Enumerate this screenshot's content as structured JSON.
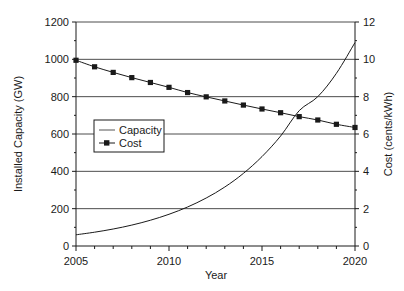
{
  "chart_data": {
    "type": "line",
    "title": "",
    "xlabel": "Year",
    "ylabel": "Installed Capacity (GW)",
    "y2label": "Cost  (cents/kWh)",
    "x": [
      2005,
      2006,
      2007,
      2008,
      2009,
      2010,
      2011,
      2012,
      2013,
      2014,
      2015,
      2016,
      2017,
      2018,
      2019,
      2020
    ],
    "xlim": [
      2005,
      2020
    ],
    "ylim": [
      0,
      1200
    ],
    "y2lim": [
      0,
      12
    ],
    "xticks": [
      2005,
      2010,
      2015,
      2020
    ],
    "xtick_labels": [
      "2005",
      "2010",
      "2015",
      "2020"
    ],
    "xminor_step": 1,
    "yticks": [
      0,
      200,
      400,
      600,
      800,
      1000,
      1200
    ],
    "ytick_labels": [
      "0",
      "200",
      "400",
      "600",
      "800",
      "1000",
      "1200"
    ],
    "y2ticks": [
      0,
      2,
      4,
      6,
      8,
      10,
      12
    ],
    "y2tick_labels": [
      "0",
      "2",
      "4",
      "6",
      "8",
      "10",
      "12"
    ],
    "grid": "horizontal",
    "legend_position": "center-left",
    "series": [
      {
        "name": "Capacity",
        "axis": "left",
        "units": "GW",
        "marker": "none",
        "line": "solid",
        "color": "#1a1a1a",
        "values": [
          60,
          74,
          91,
          112,
          138,
          170,
          209,
          257,
          316,
          389,
          479,
          589,
          725,
          800,
          925,
          1090
        ]
      },
      {
        "name": "Cost",
        "axis": "right",
        "units": "cents/kWh",
        "marker": "square",
        "line": "solid",
        "color": "#1a1a1a",
        "values": [
          9.95,
          9.6,
          9.3,
          9.02,
          8.76,
          8.5,
          8.22,
          7.99,
          7.77,
          7.55,
          7.34,
          7.14,
          6.93,
          6.75,
          6.52,
          6.35
        ]
      }
    ]
  },
  "legend": {
    "entries": [
      {
        "label": "Capacity",
        "marker": "line"
      },
      {
        "label": "Cost",
        "marker": "line-square"
      }
    ]
  },
  "colors": {
    "axis": "#1a1a1a",
    "grid": "#4d4d4d",
    "series": "#1a1a1a",
    "background": "#ffffff"
  }
}
